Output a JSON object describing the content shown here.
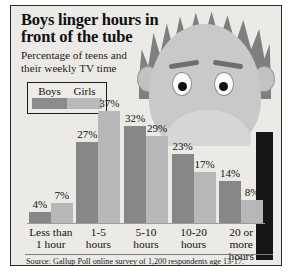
{
  "headline": {
    "title_line1": "Boys linger hours in",
    "title_line2": "front of the tube",
    "subtitle_line1": "Percentage of teens and",
    "subtitle_line2": "their weekly TV time"
  },
  "legend": {
    "boys_label": "Boys",
    "girls_label": "Girls",
    "boys_color": "#878787",
    "girls_color": "#b7b7b7"
  },
  "source": {
    "text": "Source: Gallup Poll online survey of 1,200 respondents age 13-17."
  },
  "illustration": {
    "name": "cartoon-boy-head",
    "hair_color": "#7f7f7f",
    "face_color": "#c9c9c9"
  },
  "chart_data": {
    "type": "bar",
    "title": "Boys linger hours in front of the tube",
    "subtitle": "Percentage of teens and their weekly TV time",
    "xlabel": "",
    "ylabel": "",
    "ylim": [
      0,
      40
    ],
    "grid": false,
    "legend_position": "top-left",
    "categories": [
      "Less than 1 hour",
      "1-5 hours",
      "5-10 hours",
      "10-20 hours",
      "20 or more hours"
    ],
    "category_lines": [
      [
        "Less than",
        "1 hour"
      ],
      [
        "1-5",
        "hours"
      ],
      [
        "5-10",
        "hours"
      ],
      [
        "10-20",
        "hours"
      ],
      [
        "20 or more",
        "hours"
      ]
    ],
    "series": [
      {
        "name": "Boys",
        "color": "#878787",
        "values": [
          4,
          27,
          32,
          23,
          14
        ],
        "labels": [
          "4%",
          "27%",
          "32%",
          "23%",
          "14%"
        ]
      },
      {
        "name": "Girls",
        "color": "#b7b7b7",
        "values": [
          7,
          37,
          29,
          17,
          8
        ],
        "labels": [
          "7%",
          "37%",
          "29%",
          "17%",
          "8%"
        ]
      }
    ]
  }
}
